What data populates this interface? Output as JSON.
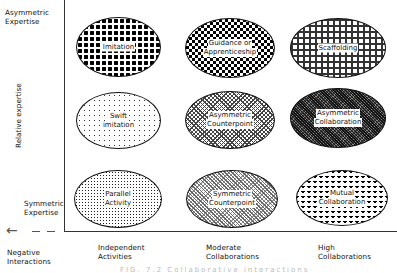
{
  "diagram": {
    "y_axis": {
      "title": "Relative expertise",
      "top_label": [
        "Asymmetric",
        "Expertise"
      ],
      "bottom_label": [
        "Symmetric",
        "Expertise"
      ]
    },
    "x_axis": {
      "negative_label": [
        "Negative",
        "Interactions"
      ],
      "categories": [
        {
          "line1": "Independent",
          "line2": "Activities"
        },
        {
          "line1": "Moderate",
          "line2": "Collaborations"
        },
        {
          "line1": "High",
          "line2": "Collaborations"
        }
      ]
    },
    "cells": [
      {
        "row": "asymmetric",
        "col": "independent",
        "line1": "Imitation",
        "line2": "",
        "pattern": "dots-big"
      },
      {
        "row": "asymmetric",
        "col": "moderate",
        "line1": "Guidance or",
        "line2": "Apprenticeship",
        "pattern": "checker"
      },
      {
        "row": "asymmetric",
        "col": "high",
        "line1": "Scaffolding",
        "line2": "",
        "pattern": "grid"
      },
      {
        "row": "middle",
        "col": "independent",
        "line1": "Swift",
        "line2": "imitation",
        "pattern": "sparse-dots"
      },
      {
        "row": "middle",
        "col": "moderate",
        "line1": "Asymmetric",
        "line2": "Counterpoint",
        "pattern": "zigzag"
      },
      {
        "row": "middle",
        "col": "high",
        "line1": "Asymmetric",
        "line2": "Collaboration",
        "pattern": "dark-fine"
      },
      {
        "row": "symmetric",
        "col": "independent",
        "line1": "Parallel",
        "line2": "Activity",
        "pattern": "fine-dots"
      },
      {
        "row": "symmetric",
        "col": "moderate",
        "line1": "Symmetric",
        "line2": "Counterpoint",
        "pattern": "diag-fine"
      },
      {
        "row": "symmetric",
        "col": "high",
        "line1": "Mutual",
        "line2": "Collaboration",
        "pattern": "triangles"
      }
    ],
    "arrow_glyph": "←",
    "caption": "FIG. 7.2  Collaborative interactions"
  }
}
